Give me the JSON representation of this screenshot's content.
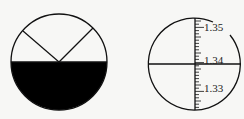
{
  "diagram": {
    "left_view": {
      "description": "Eyepiece field of view: upper half bright with two crosshair lines meeting at center, lower half dark",
      "upper_fill": "#ffffff",
      "lower_fill": "#000000"
    },
    "right_view": {
      "description": "Eyepiece field with crosshair and refractive index scale",
      "scale_labels": [
        "1.35",
        "1.34",
        "1.33"
      ],
      "scale_range": [
        1.33,
        1.35
      ]
    },
    "colors": {
      "stroke": "#111111",
      "background": "#f7f7f5"
    }
  }
}
